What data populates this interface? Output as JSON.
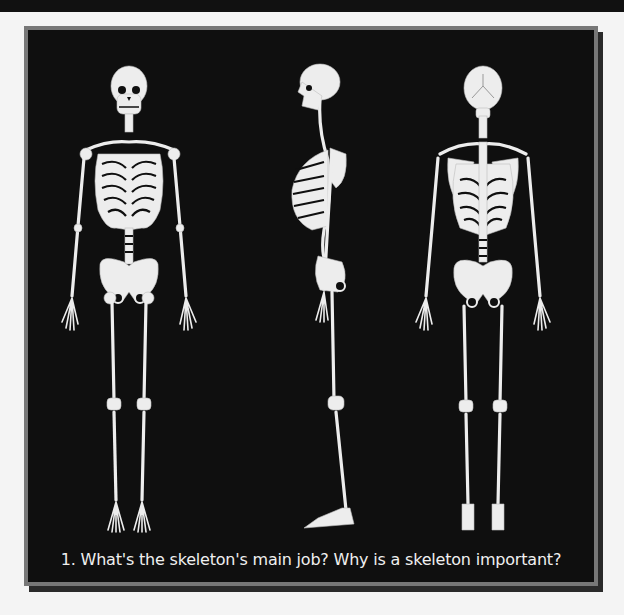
{
  "figure": {
    "caption": "1. What's the skeleton's main job? Why is a skeleton important?",
    "views": [
      {
        "name": "front-view",
        "label": "Anterior skeleton"
      },
      {
        "name": "side-view",
        "label": "Lateral skeleton"
      },
      {
        "name": "back-view",
        "label": "Posterior skeleton"
      }
    ]
  },
  "colors": {
    "panel_background": "#0f0f0f",
    "frame_border": "#777777",
    "bone": "#ededed",
    "caption_text": "#f0f0f0"
  }
}
